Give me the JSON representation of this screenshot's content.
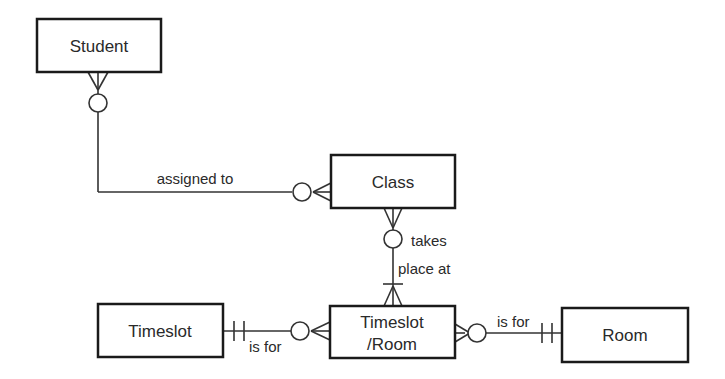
{
  "diagram": {
    "type": "entity-relationship",
    "entities": [
      {
        "id": "student",
        "label": "Student"
      },
      {
        "id": "class",
        "label": "Class"
      },
      {
        "id": "timeslot",
        "label": "Timeslot"
      },
      {
        "id": "timeslot_room",
        "label_line1": "Timeslot",
        "label_line2": "/Room"
      },
      {
        "id": "room",
        "label": "Room"
      }
    ],
    "relationships": [
      {
        "from": "student",
        "to": "class",
        "label": "assigned to",
        "from_card": "zero-or-many",
        "to_card": "zero-or-many"
      },
      {
        "from": "class",
        "to": "timeslot_room",
        "label_line1": "takes",
        "label_line2": "place at",
        "from_card": "zero-or-many",
        "to_card": "one-or-many"
      },
      {
        "from": "timeslot",
        "to": "timeslot_room",
        "label": "is for",
        "from_card": "exactly-one",
        "to_card": "zero-or-many"
      },
      {
        "from": "timeslot_room",
        "to": "room",
        "label": "is for",
        "from_card": "zero-or-many",
        "to_card": "exactly-one"
      }
    ],
    "colors": {
      "stroke": "#1a1a1a",
      "background": "#ffffff"
    }
  }
}
